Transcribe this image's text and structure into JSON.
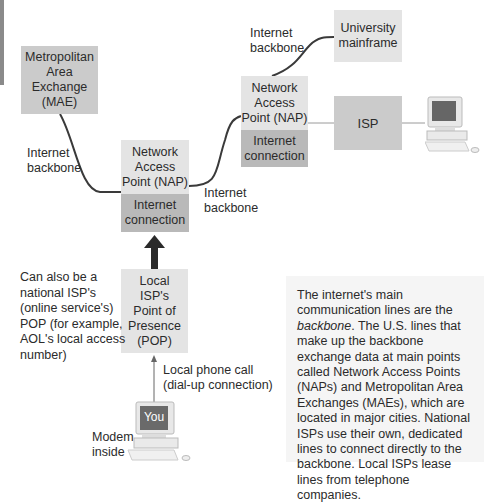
{
  "diagram": {
    "nodes": {
      "mae": "Metropolitan\nArea\nExchange\n(MAE)",
      "nap_center": "Network\nAccess\nPoint (NAP)",
      "nap_center_connection": "Internet\nconnection",
      "nap_right": "Network\nAccess\nPoint (NAP)",
      "nap_right_connection": "Internet\nconnection",
      "university": "University\nmainframe",
      "isp": "ISP",
      "pop": "Local\nISP's\nPoint of\nPresence\n(POP)",
      "you": "You"
    },
    "labels": {
      "backbone_left": "Internet\nbackbone",
      "backbone_center": "Internet\nbackbone",
      "backbone_top": "Internet\nbackbone",
      "pop_note": "Can also be a\nnational ISP's\n(online service's)\nPOP (for example,\nAOL's local access\nnumber)",
      "phone_call": "Local phone call\n(dial-up connection)",
      "modem": "Modem\ninside"
    },
    "note": {
      "part1": "The internet's main communication lines are the ",
      "emphasis": "backbone",
      "part2": ". The U.S. lines that make up the backbone exchange data at main points called Network Access Points (NAPs) and Metropolitan Area Exchanges (MAEs), which are located in major cities. National ISPs use their own, dedicated lines to connect directly to the backbone. Local ISPs lease lines from telephone companies."
    },
    "colors": {
      "box_mid": "#cbcbcb",
      "box_light": "#e4e4e4",
      "box_dark": "#b9b9b9",
      "line": "#3a3a3a",
      "note_bg": "#f5f5f5"
    }
  }
}
